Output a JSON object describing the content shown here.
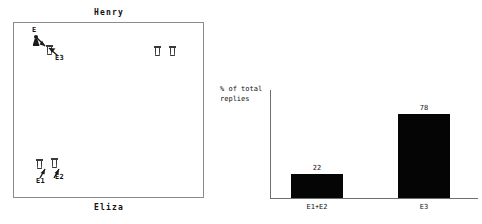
{
  "scene": {
    "top_label": "Henry",
    "bottom_label": "Eliza",
    "markers": [
      {
        "id": "E",
        "label": "E",
        "x": 18,
        "y": 12,
        "kind": "person"
      },
      {
        "id": "E3",
        "label": "E3",
        "x": 30,
        "y": 22,
        "kind": "cup"
      },
      {
        "id": "c1",
        "label": "",
        "x": 140,
        "y": 23,
        "kind": "cup"
      },
      {
        "id": "c2",
        "label": "",
        "x": 155,
        "y": 23,
        "kind": "cup"
      },
      {
        "id": "E1",
        "label": "E1",
        "x": 22,
        "y": 138,
        "kind": "cup"
      },
      {
        "id": "E2",
        "label": "E2",
        "x": 36,
        "y": 138,
        "kind": "cup"
      }
    ]
  },
  "chart_data": {
    "type": "bar",
    "title": "",
    "xlabel": "",
    "ylabel": "% of total\nreplies",
    "categories": [
      "E1+E2",
      "E3"
    ],
    "values": [
      22,
      78
    ],
    "ylim": [
      0,
      100
    ],
    "grid": false,
    "legend": null,
    "bar_color": "#050505",
    "data_labels": [
      "22",
      "78"
    ]
  }
}
